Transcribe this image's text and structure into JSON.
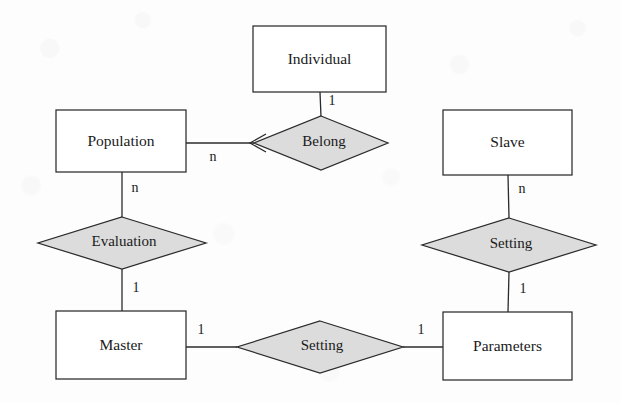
{
  "diagram": {
    "kind": "entity-relationship-diagram",
    "canvas": {
      "width": 621,
      "height": 403
    },
    "colors": {
      "background": "#fdfdfd",
      "entity_fill": "#ffffff",
      "relationship_fill": "#dcdcdc",
      "stroke": "#2b2b2b",
      "text": "#1a1a1a"
    },
    "entities": [
      {
        "id": "individual",
        "label": "Individual",
        "x": 253,
        "y": 26,
        "w": 133,
        "h": 66
      },
      {
        "id": "population",
        "label": "Population",
        "x": 56,
        "y": 110,
        "w": 130,
        "h": 62
      },
      {
        "id": "slave",
        "label": "Slave",
        "x": 443,
        "y": 110,
        "w": 129,
        "h": 65
      },
      {
        "id": "master",
        "label": "Master",
        "x": 56,
        "y": 311,
        "w": 130,
        "h": 68
      },
      {
        "id": "parameters",
        "label": "Parameters",
        "x": 443,
        "y": 312,
        "w": 129,
        "h": 68
      }
    ],
    "relationships": [
      {
        "id": "belong",
        "label": "Belong",
        "cx": 321,
        "cy": 143,
        "rx": 67,
        "ry": 27
      },
      {
        "id": "evaluation",
        "label": "Evaluation",
        "cx": 122,
        "cy": 243,
        "rx": 84,
        "ry": 26
      },
      {
        "id": "setting-slave",
        "label": "Setting",
        "cx": 509,
        "cy": 245,
        "rx": 87,
        "ry": 27
      },
      {
        "id": "setting-master",
        "label": "Setting",
        "cx": 320,
        "cy": 347,
        "rx": 83,
        "ry": 26
      }
    ],
    "connections": [
      {
        "id": "individual-belong",
        "from": "individual",
        "to": "belong",
        "cardinality": "1",
        "label_x": 332,
        "label_y": 102
      },
      {
        "id": "population-belong",
        "from": "population",
        "to": "belong",
        "cardinality": "n",
        "label_x": 213,
        "label_y": 158
      },
      {
        "id": "population-evaluation",
        "from": "population",
        "to": "evaluation",
        "cardinality": "n",
        "label_x": 135,
        "label_y": 189
      },
      {
        "id": "evaluation-master",
        "from": "evaluation",
        "to": "master",
        "cardinality": "1",
        "label_x": 136,
        "label_y": 289
      },
      {
        "id": "slave-setting",
        "from": "slave",
        "to": "setting-slave",
        "cardinality": "n",
        "label_x": 522,
        "label_y": 190
      },
      {
        "id": "setting-parameters",
        "from": "setting-slave",
        "to": "parameters",
        "cardinality": "1",
        "label_x": 523,
        "label_y": 290
      },
      {
        "id": "master-setting",
        "from": "master",
        "to": "setting-master",
        "cardinality": "1",
        "label_x": 201,
        "label_y": 331
      },
      {
        "id": "setting-parameters-side",
        "from": "setting-master",
        "to": "parameters",
        "cardinality": "1",
        "label_x": 421,
        "label_y": 331
      }
    ]
  }
}
